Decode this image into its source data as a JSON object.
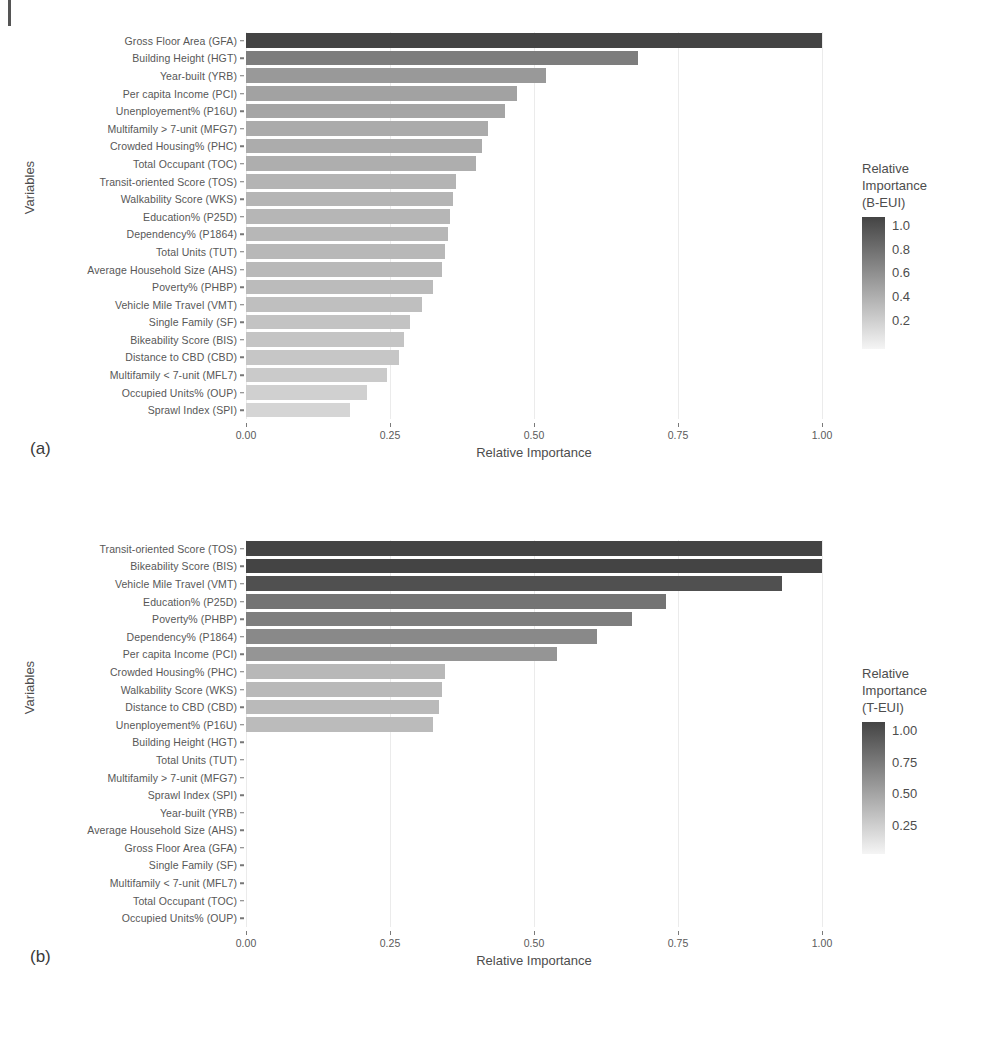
{
  "figure": {
    "panel_a_letter": "(a)",
    "panel_b_letter": "(b)",
    "x_axis_title": "Relative Importance",
    "y_axis_title": "Variables"
  },
  "chart_data": [
    {
      "type": "bar",
      "orientation": "horizontal",
      "panel": "(a)",
      "title": "",
      "xlabel": "Relative Importance",
      "ylabel": "Variables",
      "xlim": [
        0,
        1.06
      ],
      "xticks": [
        0.0,
        0.25,
        0.5,
        0.75,
        1.0
      ],
      "xticklabels": [
        "0.00",
        "0.25",
        "0.50",
        "0.75",
        "1.00"
      ],
      "grid": true,
      "legend": {
        "title": "Relative\nImportance\n(B-EUI)",
        "position": "right",
        "ticks": [
          1.0,
          0.8,
          0.6,
          0.4,
          0.2
        ],
        "ticklabels": [
          "1.0",
          "0.8",
          "0.6",
          "0.4",
          "0.2"
        ],
        "colormap": [
          "#f2f2f2",
          "#4a4a4a"
        ]
      },
      "categories": [
        "Gross Floor Area (GFA)",
        "Building Height (HGT)",
        "Year-built (YRB)",
        "Per capita Income (PCI)",
        "Unenployement% (P16U)",
        "Multifamily > 7-unit (MFG7)",
        "Crowded Housing% (PHC)",
        "Total Occupant (TOC)",
        "Transit-oriented Score (TOS)",
        "Walkability Score (WKS)",
        "Education% (P25D)",
        "Dependency% (P1864)",
        "Total Units (TUT)",
        "Average Household Size (AHS)",
        "Poverty% (PHBP)",
        "Vehicle Mile Travel (VMT)",
        "Single Family (SF)",
        "Bikeability Score (BIS)",
        "Distance to CBD (CBD)",
        "Multifamily < 7-unit (MFL7)",
        "Occupied Units% (OUP)",
        "Sprawl Index (SPI)"
      ],
      "values": [
        1.0,
        0.68,
        0.52,
        0.47,
        0.45,
        0.42,
        0.41,
        0.4,
        0.365,
        0.36,
        0.355,
        0.35,
        0.345,
        0.34,
        0.325,
        0.305,
        0.285,
        0.275,
        0.265,
        0.245,
        0.21,
        0.18
      ]
    },
    {
      "type": "bar",
      "orientation": "horizontal",
      "panel": "(b)",
      "title": "",
      "xlabel": "Relative Importance",
      "ylabel": "Variables",
      "xlim": [
        0,
        1.06
      ],
      "xticks": [
        0.0,
        0.25,
        0.5,
        0.75,
        1.0
      ],
      "xticklabels": [
        "0.00",
        "0.25",
        "0.50",
        "0.75",
        "1.00"
      ],
      "grid": true,
      "legend": {
        "title": "Relative\nImportance\n(T-EUI)",
        "position": "right",
        "ticks": [
          1.0,
          0.75,
          0.5,
          0.25
        ],
        "ticklabels": [
          "1.00",
          "0.75",
          "0.50",
          "0.25"
        ],
        "colormap": [
          "#f2f2f2",
          "#4a4a4a"
        ]
      },
      "categories": [
        "Transit-oriented Score (TOS)",
        "Bikeability Score (BIS)",
        "Vehicle Mile Travel (VMT)",
        "Education% (P25D)",
        "Poverty% (PHBP)",
        "Dependency% (P1864)",
        "Per capita Income (PCI)",
        "Crowded Housing% (PHC)",
        "Walkability Score (WKS)",
        "Distance to CBD (CBD)",
        "Unenployement% (P16U)",
        "Building Height (HGT)",
        "Total Units (TUT)",
        "Multifamily > 7-unit (MFG7)",
        "Sprawl Index (SPI)",
        "Year-built (YRB)",
        "Average Household Size (AHS)",
        "Gross Floor Area (GFA)",
        "Single Family (SF)",
        "Multifamily < 7-unit (MFL7)",
        "Total Occupant (TOC)",
        "Occupied Units% (OUP)"
      ],
      "values": [
        1.0,
        1.0,
        0.93,
        0.73,
        0.67,
        0.61,
        0.54,
        0.345,
        0.34,
        0.335,
        0.325,
        0.0,
        0.0,
        0.0,
        0.0,
        0.0,
        0.0,
        0.0,
        0.0,
        0.0,
        0.0,
        0.0
      ]
    }
  ]
}
